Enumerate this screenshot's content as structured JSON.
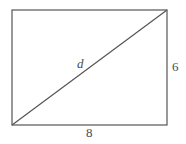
{
  "figure": {
    "type": "geometry-diagram",
    "shape": "rectangle-with-diagonal",
    "background_color": "#ffffff",
    "stroke_color": "#555555",
    "label_color": "#4a4a4a",
    "stroke_width": 1.2,
    "rectangle": {
      "left": 12,
      "top": 10,
      "right": 167,
      "bottom": 125,
      "width_px": 155,
      "height_px": 115
    },
    "diagonal": {
      "x1": 12,
      "y1": 125,
      "x2": 167,
      "y2": 10
    },
    "labels": {
      "diagonal": "d",
      "height": "6",
      "width": "8"
    }
  }
}
